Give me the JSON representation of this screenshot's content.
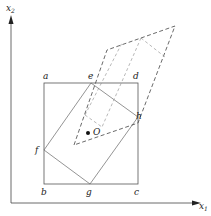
{
  "axes": {
    "x_label": "x",
    "x_sub": "1",
    "y_label": "x",
    "y_sub": "2"
  },
  "points": {
    "a": "a",
    "b": "b",
    "c": "c",
    "d": "d",
    "e": "e",
    "f": "f",
    "g": "g",
    "h": "h",
    "O": "O"
  },
  "colors": {
    "line": "#444444",
    "light_line": "#888888"
  }
}
